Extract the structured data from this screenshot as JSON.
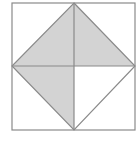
{
  "diagram": {
    "type": "geometric-figure",
    "outer_square": {
      "x1": 12,
      "y1": 3,
      "x2": 135,
      "y2": 130
    },
    "center": {
      "x": 74,
      "y": 66
    },
    "diamond_vertices": {
      "top": {
        "x": 74,
        "y": 3
      },
      "right": {
        "x": 135,
        "y": 66
      },
      "bottom": {
        "x": 74,
        "y": 130
      },
      "left": {
        "x": 12,
        "y": 66
      }
    },
    "shaded_regions": [
      "top-left-triangle",
      "top-right-triangle",
      "bottom-left-triangle"
    ],
    "unshaded_regions": [
      "bottom-right-triangle"
    ],
    "colors": {
      "stroke": "#8a8a8a",
      "shade": "#d3d3d3",
      "background": "#ffffff"
    }
  }
}
